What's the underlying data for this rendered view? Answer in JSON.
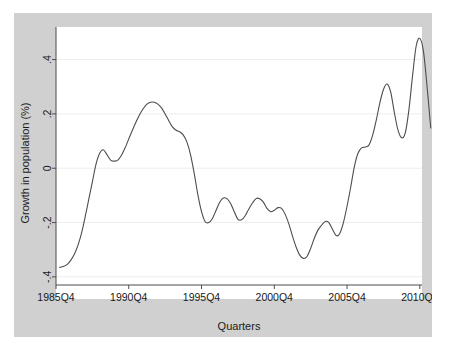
{
  "chart_data": {
    "type": "line",
    "title": "",
    "xlabel": "Quarters",
    "ylabel": "Growth in population (%)",
    "xtick_labels": [
      "1985Q4",
      "1990Q4",
      "1995Q4",
      "2000Q4",
      "2005Q4",
      "2010Q4"
    ],
    "xtick_values": [
      1985.75,
      1990.75,
      1995.75,
      2000.75,
      2005.75,
      2010.75
    ],
    "ytick_labels": [
      ".4",
      ".2",
      "0",
      "-.2",
      "-.4"
    ],
    "ytick_values": [
      0.4,
      0.2,
      0,
      -0.2,
      -0.4
    ],
    "xlim": [
      1985.75,
      2010.9
    ],
    "ylim": [
      -0.43,
      0.52
    ],
    "grid": "horizontal",
    "legend": "none",
    "line_color": "#4d4d4d",
    "plot_bg": "#ffffff",
    "figure_bg": "#d0d0d0",
    "series": [
      {
        "name": "Growth in population (%)",
        "x": [
          1986.0,
          1986.25,
          1986.5,
          1986.75,
          1987.0,
          1987.25,
          1987.5,
          1987.75,
          1988.0,
          1988.25,
          1988.5,
          1988.75,
          1989.0,
          1989.25,
          1989.5,
          1989.75,
          1990.0,
          1990.25,
          1990.5,
          1990.75,
          1991.0,
          1991.25,
          1991.5,
          1991.75,
          1992.0,
          1992.25,
          1992.5,
          1992.75,
          1993.0,
          1993.25,
          1993.5,
          1993.75,
          1994.0,
          1994.25,
          1994.5,
          1994.75,
          1995.0,
          1995.25,
          1995.5,
          1995.75,
          1996.0,
          1996.25,
          1996.5,
          1996.75,
          1997.0,
          1997.25,
          1997.5,
          1997.75,
          1998.0,
          1998.25,
          1998.5,
          1998.75,
          1999.0,
          1999.25,
          1999.5,
          1999.75,
          2000.0,
          2000.25,
          2000.5,
          2000.75,
          2001.0,
          2001.25,
          2001.5,
          2001.75,
          2002.0,
          2002.25,
          2002.5,
          2002.75,
          2003.0,
          2003.25,
          2003.5,
          2003.75,
          2004.0,
          2004.25,
          2004.5,
          2004.75,
          2005.0,
          2005.25,
          2005.5,
          2005.75,
          2006.0,
          2006.25,
          2006.5,
          2006.75,
          2007.0,
          2007.25,
          2007.5,
          2007.75,
          2008.0,
          2008.25,
          2008.5,
          2008.75,
          2009.0,
          2009.25,
          2009.5,
          2009.75,
          2010.0,
          2010.25,
          2010.5,
          2010.75
        ],
        "y": [
          -0.365,
          -0.362,
          -0.355,
          -0.34,
          -0.318,
          -0.285,
          -0.24,
          -0.18,
          -0.115,
          -0.05,
          0.015,
          0.055,
          0.068,
          0.05,
          0.03,
          0.026,
          0.03,
          0.048,
          0.075,
          0.108,
          0.14,
          0.17,
          0.198,
          0.22,
          0.236,
          0.243,
          0.243,
          0.236,
          0.222,
          0.2,
          0.175,
          0.152,
          0.14,
          0.134,
          0.122,
          0.096,
          0.048,
          -0.02,
          -0.098,
          -0.16,
          -0.197,
          -0.2,
          -0.185,
          -0.155,
          -0.125,
          -0.11,
          -0.112,
          -0.13,
          -0.16,
          -0.188,
          -0.19,
          -0.175,
          -0.15,
          -0.128,
          -0.112,
          -0.112,
          -0.125,
          -0.148,
          -0.16,
          -0.155,
          -0.145,
          -0.148,
          -0.17,
          -0.205,
          -0.25,
          -0.29,
          -0.32,
          -0.332,
          -0.325,
          -0.295,
          -0.258,
          -0.228,
          -0.21,
          -0.196,
          -0.2,
          -0.225,
          -0.248,
          -0.24,
          -0.2,
          -0.14,
          -0.07,
          0.005,
          0.055,
          0.075,
          0.078,
          0.085,
          0.12,
          0.175,
          0.24,
          0.29,
          0.31,
          0.28,
          0.205,
          0.14,
          0.112,
          0.13,
          0.215,
          0.34,
          0.45,
          0.478
        ]
      }
    ],
    "series_tail": {
      "x": [
        2010.75,
        2011.0,
        2011.25,
        2011.5
      ],
      "y": [
        0.478,
        0.43,
        0.3,
        0.148
      ]
    }
  },
  "axes": {
    "xlabel": "Quarters",
    "ylabel": "Growth in population (%)"
  }
}
